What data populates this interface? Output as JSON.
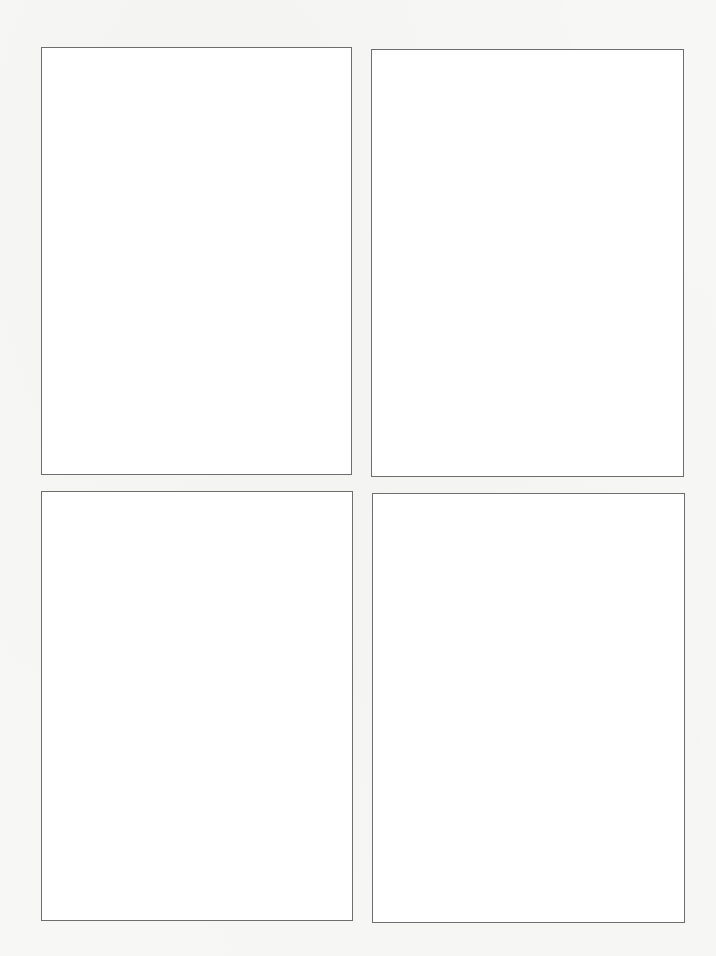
{
  "document": {
    "type": "scanned-page",
    "background_color": "#f7f7f5",
    "panel_border_color": "#6e6e6e",
    "panels": [
      {
        "id": "top-left",
        "content": ""
      },
      {
        "id": "top-right",
        "content": ""
      },
      {
        "id": "bottom-left",
        "content": ""
      },
      {
        "id": "bottom-right",
        "content": ""
      }
    ]
  }
}
